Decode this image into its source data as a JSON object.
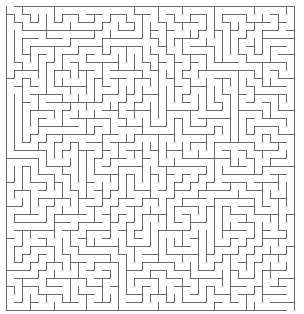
{
  "maze": {
    "cols": 36,
    "rows": 38,
    "cell_size": 8,
    "offset_x": 6,
    "offset_y": 6,
    "wall_color": "#6b6b6b",
    "background_color": "#ffffff",
    "wall_width": 1,
    "seed": 20240613
  }
}
